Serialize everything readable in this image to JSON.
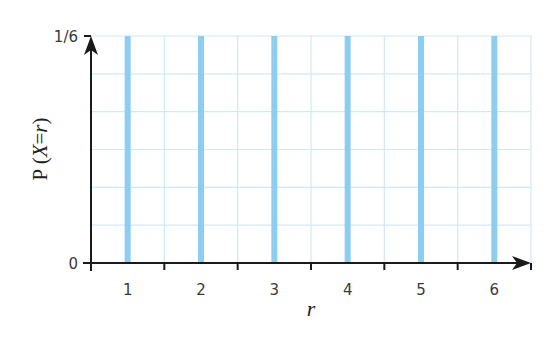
{
  "chart_data": {
    "type": "bar",
    "title": "",
    "xlabel": "r",
    "ylabel": "P (X=r)",
    "ylabel_parts": {
      "prefix": "P (",
      "var": "X",
      "eq": "=",
      "arg": "r",
      "suffix": ")"
    },
    "categories": [
      "1",
      "2",
      "3",
      "4",
      "5",
      "6"
    ],
    "x": [
      1,
      2,
      3,
      4,
      5,
      6
    ],
    "values": [
      0.16667,
      0.16667,
      0.16667,
      0.16667,
      0.16667,
      0.16667
    ],
    "value_labels": [
      "1/6",
      "1/6",
      "1/6",
      "1/6",
      "1/6",
      "1/6"
    ],
    "xlim": [
      0.5,
      6.5
    ],
    "ylim": [
      0,
      0.16667
    ],
    "y_ticks": [
      {
        "value": 0,
        "label": "0"
      },
      {
        "value": 0.16667,
        "label": "1/6"
      }
    ],
    "x_ticks": [
      1.5,
      2.5,
      3.5,
      4.5,
      5.5
    ],
    "grid": true,
    "grid_y_divisions": 6,
    "grid_x_step": 0.5,
    "legend": "none",
    "colors": {
      "bar": "#8ccdf0",
      "grid": "#cfe9f7",
      "axis": "#1a1a1a"
    }
  }
}
